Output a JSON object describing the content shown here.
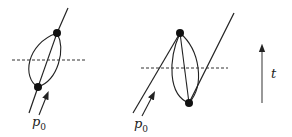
{
  "diagrams": [
    {
      "name": "left-diagram",
      "label": "p",
      "label_sub": "0",
      "description": "Worldline with loop of two propagators between two vertices"
    },
    {
      "name": "right-diagram",
      "label": "p",
      "label_sub": "0",
      "description": "Worldline going forward, vertex, three propagators back down, then line continues upward"
    }
  ],
  "time_axis": {
    "label": "t"
  },
  "colors": {
    "stroke": "#222222",
    "dashed": "#333333"
  }
}
